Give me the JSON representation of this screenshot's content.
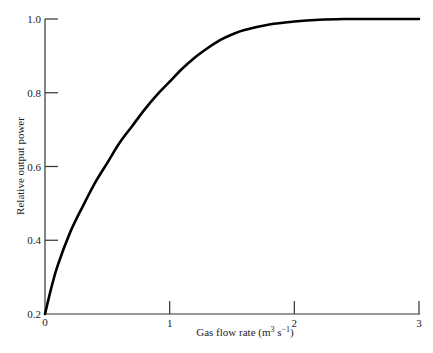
{
  "chart_data": {
    "type": "line",
    "title": "",
    "xlabel": "Gas flow rate (m³ s⁻¹)",
    "ylabel": "Relative output power",
    "xlim": [
      0,
      3
    ],
    "ylim": [
      0.2,
      1.0
    ],
    "xticks": [
      "0",
      "1",
      "2",
      "3"
    ],
    "yticks": [
      "0.2",
      "0.4",
      "0.6",
      "0.8",
      "1.0"
    ],
    "grid": false,
    "legend": null,
    "series": [
      {
        "name": "Relative output power",
        "x": [
          0,
          0.05,
          0.1,
          0.2,
          0.3,
          0.4,
          0.5,
          0.6,
          0.7,
          0.8,
          0.9,
          1.0,
          1.1,
          1.2,
          1.3,
          1.4,
          1.5,
          1.6,
          1.8,
          2.0,
          2.2,
          2.4,
          2.6,
          2.8,
          3.0
        ],
        "y": [
          0.2,
          0.27,
          0.33,
          0.42,
          0.49,
          0.555,
          0.61,
          0.665,
          0.71,
          0.755,
          0.795,
          0.83,
          0.865,
          0.895,
          0.92,
          0.942,
          0.958,
          0.97,
          0.985,
          0.993,
          0.998,
          1.0,
          1.0,
          1.0,
          1.0
        ]
      }
    ]
  }
}
